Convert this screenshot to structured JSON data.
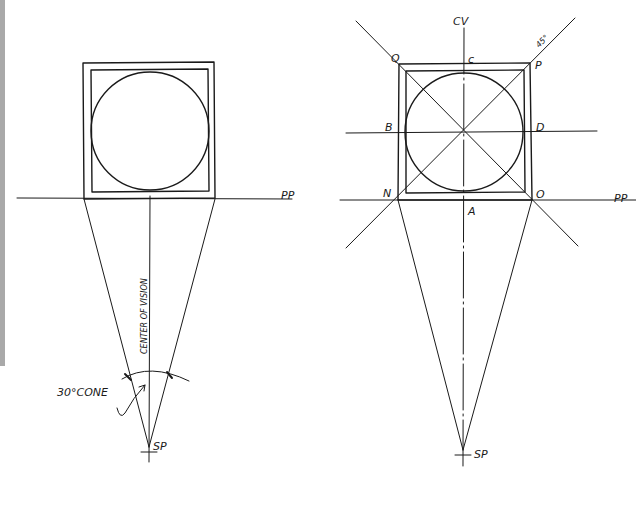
{
  "figure": {
    "left_panel": {
      "title": "Plan view - cone of vision",
      "labels": {
        "picture_plane": "PP",
        "center_of_vision": "CENTER OF VISION",
        "cone": "30°CONE",
        "station_point": "SP"
      }
    },
    "right_panel": {
      "title": "Plan view - diagonals and tangent points",
      "labels": {
        "center_of_vision": "CV",
        "picture_plane": "PP",
        "station_point": "SP",
        "angle": "45°",
        "corners": {
          "Q": "Q",
          "P": "P",
          "N": "N",
          "O": "O"
        },
        "tangent_points": {
          "A": "A",
          "B": "B",
          "C": "c",
          "D": "D"
        }
      }
    }
  },
  "colors": {
    "ink": "#1a1a1a",
    "background": "#ffffff",
    "margin_bar": "#a9a9a9"
  }
}
